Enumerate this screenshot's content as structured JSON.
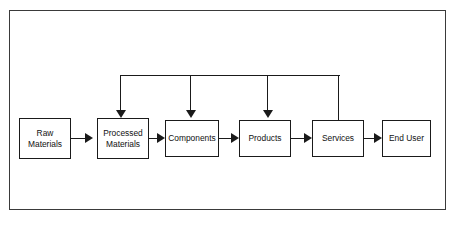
{
  "caption": {
    "text": "The Value Chain"
  },
  "diagram": {
    "colors": {
      "node_border": "#1a1a1a",
      "frame_border": "#3a3a3a",
      "connector": "#1a1a1a",
      "background": "#ffffff"
    },
    "nodes": [
      {
        "id": "raw-materials",
        "label": "Raw Materials",
        "line1": "Raw",
        "line2": "Materials",
        "x": 18,
        "y": 117,
        "w": 52,
        "h": 41
      },
      {
        "id": "processed-materials",
        "label": "Processed Materials",
        "line1": "Processed",
        "line2": "Materials",
        "x": 96,
        "y": 117,
        "w": 52,
        "h": 41
      },
      {
        "id": "components",
        "label": "Components",
        "line1": "Components",
        "line2": "",
        "x": 164,
        "y": 119,
        "w": 54,
        "h": 37
      },
      {
        "id": "products",
        "label": "Products",
        "line1": "Products",
        "line2": "",
        "x": 238,
        "y": 119,
        "w": 52,
        "h": 37
      },
      {
        "id": "services",
        "label": "Services",
        "line1": "Services",
        "line2": "",
        "x": 311,
        "y": 119,
        "w": 52,
        "h": 37
      },
      {
        "id": "end-user",
        "label": "End User",
        "line1": "End User",
        "line2": "",
        "x": 381,
        "y": 119,
        "w": 49,
        "h": 37
      }
    ],
    "forward_connectors": [
      {
        "from": "raw-materials",
        "to": "processed-materials"
      },
      {
        "from": "processed-materials",
        "to": "components"
      },
      {
        "from": "components",
        "to": "products"
      },
      {
        "from": "products",
        "to": "services"
      },
      {
        "from": "services",
        "to": "end-user"
      }
    ],
    "feedback_connectors": [
      {
        "from": "services",
        "to": "processed-materials"
      },
      {
        "from": "services",
        "to": "components"
      },
      {
        "from": "services",
        "to": "products"
      }
    ]
  }
}
